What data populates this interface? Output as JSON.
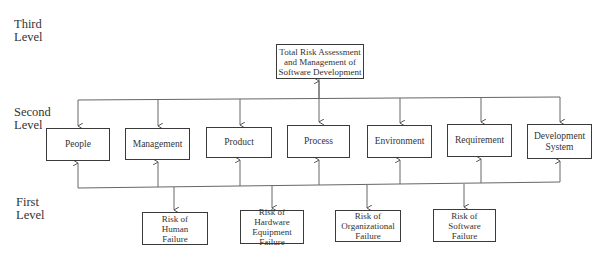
{
  "level_labels": {
    "third": "Third\nLevel",
    "second": "Second\nLevel",
    "first": "First\nLevel"
  },
  "third_level": {
    "root": "Total Risk Assessment\nand Management of\nSoftware Development"
  },
  "second_level": {
    "nodes": [
      {
        "id": "people",
        "label": "People"
      },
      {
        "id": "management",
        "label": "Management"
      },
      {
        "id": "product",
        "label": "Product"
      },
      {
        "id": "process",
        "label": "Process"
      },
      {
        "id": "environment",
        "label": "Environment"
      },
      {
        "id": "requirement",
        "label": "Requirement"
      },
      {
        "id": "development-system",
        "label": "Development\nSystem"
      }
    ]
  },
  "first_level": {
    "nodes": [
      {
        "id": "human",
        "label": "Risk of\nHuman\nFailure"
      },
      {
        "id": "hardware",
        "label": "Risk of Hardware\nEquipment\nFailure"
      },
      {
        "id": "organizational",
        "label": "Risk of\nOrganizational\nFailure"
      },
      {
        "id": "software",
        "label": "Risk of\nSoftware\nFailure"
      }
    ]
  },
  "colors": {
    "line": "#555555",
    "box_border": "#3a3a3a",
    "text": "#333333"
  }
}
